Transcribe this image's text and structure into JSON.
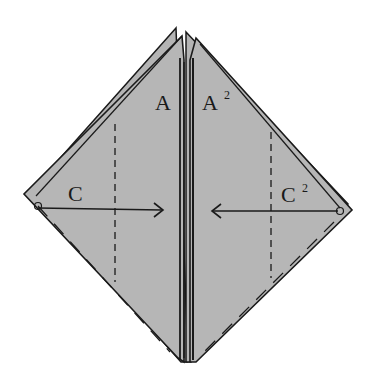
{
  "diagram": {
    "type": "origami-fold-instruction",
    "background": "#ffffff",
    "paper_color": "#b4b4b4",
    "line_color": "#1a1a1a",
    "labels": {
      "a_left": "A",
      "a_right": "A",
      "a_right_sup": "2",
      "c_left": "C",
      "c_right": "C",
      "c_right_sup": "2"
    },
    "arrows": [
      {
        "name": "fold-arrow-left-to-center",
        "from": "C",
        "direction": "right"
      },
      {
        "name": "fold-arrow-right-to-center",
        "from": "C2",
        "direction": "left"
      }
    ],
    "fold_lines": [
      {
        "name": "valley-fold-left",
        "style": "dashed"
      },
      {
        "name": "valley-fold-right",
        "style": "dashed"
      }
    ]
  }
}
